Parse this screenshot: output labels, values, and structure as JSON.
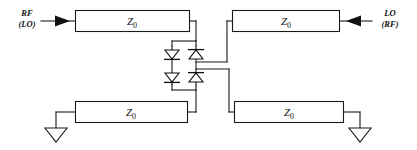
{
  "figure": {
    "type": "schematic",
    "title_text": "",
    "background_color": "#ffffff",
    "line_color": "#1a1a1a"
  },
  "ports": {
    "left": {
      "primary_label": "RF",
      "secondary_label": "(LO)",
      "arrow_direction": "right",
      "arrow_icon": "arrow-right-icon"
    },
    "right": {
      "primary_label": "LO",
      "secondary_label": "(RF)",
      "arrow_direction": "left",
      "arrow_icon": "arrow-left-icon"
    }
  },
  "transmission_lines": [
    {
      "id": "top-left",
      "label": "Z",
      "subscript": "0"
    },
    {
      "id": "top-right",
      "label": "Z",
      "subscript": "0"
    },
    {
      "id": "bottom-left",
      "label": "Z",
      "subscript": "0"
    },
    {
      "id": "bottom-right",
      "label": "Z",
      "subscript": "0"
    }
  ],
  "diodes": [
    {
      "id": "d-upper-left",
      "orientation": "down"
    },
    {
      "id": "d-upper-right",
      "orientation": "up"
    },
    {
      "id": "d-lower-left",
      "orientation": "down"
    },
    {
      "id": "d-lower-right",
      "orientation": "up"
    }
  ],
  "grounds": [
    {
      "id": "ground-left",
      "icon": "ground-triangle-icon"
    },
    {
      "id": "ground-right",
      "icon": "ground-triangle-icon"
    }
  ]
}
